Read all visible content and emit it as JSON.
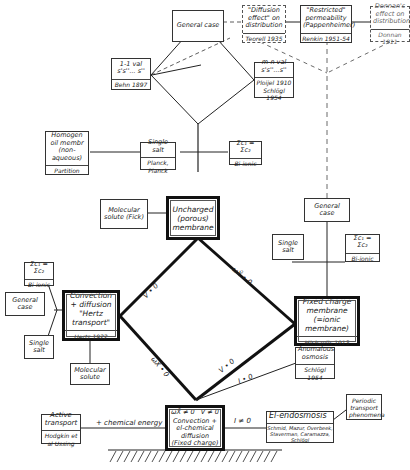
{
  "diagram": {
    "title": "",
    "nodes": {
      "general_case_top": {
        "text": "General case"
      },
      "diffusion_effect": {
        "text": "\"Diffusion effect\" on distribution",
        "cite": "Teorell 1935"
      },
      "restricted_perm": {
        "text": "\"Restricted\" permeability (Pappenheimer)",
        "cite": "Renkin 1951-54"
      },
      "donnan_effect": {
        "text": "Donnan's effect on distribution",
        "cite": "Donnan 1911"
      },
      "one_one_val": {
        "text": "1-1 val s's''... s''",
        "cite": "Behn 1897"
      },
      "m_n_val": {
        "text": "m-n val s's''...s''",
        "cite": "Ploijel 1910 Schlögl 1954"
      },
      "homogen": {
        "text": "Homogen oil membr (non-aqueous)",
        "cite": "Partition"
      },
      "single_salt_top": {
        "text": "Single salt",
        "cite": "Planck, Planck"
      },
      "biionic_top": {
        "text": "Σc₁ = Σc₂",
        "cite": "Bi-ionic"
      },
      "molecular_solute_fick": {
        "text": "Molecular solute (Fick)"
      },
      "uncharged_membrane": {
        "text": "Uncharged (porous) membrane"
      },
      "general_case_right": {
        "text": "General case"
      },
      "single_salt_right": {
        "text": "Single salt"
      },
      "biionic_right": {
        "text": "Σc₁ = Σc₂",
        "cite": "Bi-ionic"
      },
      "biionic_left": {
        "text": "Σc₁ = Σc₂",
        "cite": "Bi-ionic"
      },
      "general_case_left": {
        "text": "General case"
      },
      "convection_diffusion": {
        "text": "Convection + diffusion \"Hertz transport\"",
        "cite": "Hertz 1922"
      },
      "single_salt_left": {
        "text": "Single salt"
      },
      "molecular_solute": {
        "text": "Molecular solute"
      },
      "fixed_charge": {
        "text": "Fixed charge membrane (=ionic membrane)",
        "cite": "Michaelis 1913"
      },
      "anomalous_osmosis": {
        "text": "Anomalous osmosis",
        "cite": "Schlögl 1954"
      },
      "active_transport": {
        "text": "Active transport",
        "cite": "Hodgkin et al Ussing"
      },
      "central_bottom": {
        "header_left": "ωX̄ ≠ 0",
        "header_right": "V ≠ 0",
        "text": "Convection + el-chemical diffusion (Fixed charge)"
      },
      "el_endosmosis": {
        "text": "El-endosmosis",
        "cite": "Schmid, Mazur, Overbeek, Staverman, Caramazza, Schlögl"
      },
      "periodic_transport": {
        "text": "Periodic transport phenomena"
      }
    },
    "edge_labels": {
      "v0_left": "V • 0",
      "wx0_left": "ωX̄ • 0",
      "wx0_right": "ωX̄ • 0",
      "v0_right": "V • 0",
      "i0": "I • 0",
      "i_ne_0": "I ≠ 0",
      "chem_energy": "+ chemical energy"
    }
  }
}
